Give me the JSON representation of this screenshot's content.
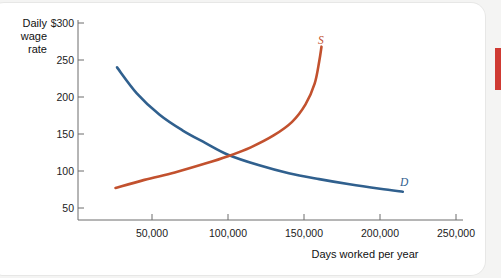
{
  "chart_data": {
    "type": "line",
    "title": "",
    "xlabel": "Days worked per year",
    "ylabel": "Daily wage rate",
    "ylabel_lines": [
      "Daily",
      "wage",
      "rate"
    ],
    "xlim": [
      0,
      275000
    ],
    "ylim": [
      0,
      320
    ],
    "grid": false,
    "legend": "inline-curve-labels",
    "x_ticks": [
      {
        "value": 50000,
        "label": "50,000"
      },
      {
        "value": 100000,
        "label": "100,000"
      },
      {
        "value": 150000,
        "label": "150,000"
      },
      {
        "value": 200000,
        "label": "200,000"
      },
      {
        "value": 250000,
        "label": "250,000"
      }
    ],
    "y_ticks": [
      {
        "value": 300,
        "label": "$300"
      },
      {
        "value": 250,
        "label": "250"
      },
      {
        "value": 200,
        "label": "200"
      },
      {
        "value": 150,
        "label": "150"
      },
      {
        "value": 100,
        "label": "100"
      },
      {
        "value": 50,
        "label": "50"
      }
    ],
    "series": [
      {
        "name": "Demand",
        "label": "D",
        "color": "#30608e",
        "points": [
          {
            "x": 27000,
            "y": 240
          },
          {
            "x": 40000,
            "y": 205
          },
          {
            "x": 55000,
            "y": 176
          },
          {
            "x": 70000,
            "y": 155
          },
          {
            "x": 85000,
            "y": 138
          },
          {
            "x": 100000,
            "y": 122
          },
          {
            "x": 120000,
            "y": 108
          },
          {
            "x": 140000,
            "y": 97
          },
          {
            "x": 160000,
            "y": 89
          },
          {
            "x": 180000,
            "y": 82
          },
          {
            "x": 200000,
            "y": 76
          },
          {
            "x": 215000,
            "y": 72
          }
        ]
      },
      {
        "name": "Supply",
        "label": "S",
        "color": "#c2512e",
        "points": [
          {
            "x": 26000,
            "y": 77
          },
          {
            "x": 45000,
            "y": 88
          },
          {
            "x": 65000,
            "y": 98
          },
          {
            "x": 85000,
            "y": 110
          },
          {
            "x": 100000,
            "y": 120
          },
          {
            "x": 115000,
            "y": 132
          },
          {
            "x": 130000,
            "y": 148
          },
          {
            "x": 142000,
            "y": 166
          },
          {
            "x": 151000,
            "y": 190
          },
          {
            "x": 157000,
            "y": 218
          },
          {
            "x": 160000,
            "y": 248
          },
          {
            "x": 161500,
            "y": 268
          }
        ]
      }
    ],
    "equilibrium": {
      "x": 100000,
      "y": 121
    }
  },
  "labels": {
    "demand_curve": "D",
    "supply_curve": "S"
  },
  "page": {
    "scroll_indicator_color": "#cf3a33"
  }
}
